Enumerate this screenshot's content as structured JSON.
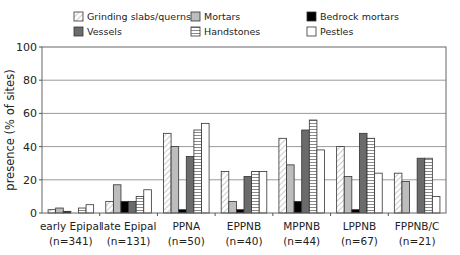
{
  "chart_data": {
    "type": "bar",
    "title": "",
    "xlabel": "",
    "ylabel": "presence (% of sites)",
    "ylim": [
      0,
      100
    ],
    "yticks": [
      0,
      20,
      40,
      60,
      80,
      100
    ],
    "grid": true,
    "legend_position": "top",
    "categories": [
      {
        "label": "early Epipal",
        "n": "(n=341)"
      },
      {
        "label": "late Epipal",
        "n": "(n=131)"
      },
      {
        "label": "PPNA",
        "n": "(n=50)"
      },
      {
        "label": "EPPNB",
        "n": "(n=40)"
      },
      {
        "label": "MPPNB",
        "n": "(n=44)"
      },
      {
        "label": "LPPNB",
        "n": "(n=67)"
      },
      {
        "label": "FPPNB/C",
        "n": "(n=21)"
      }
    ],
    "series": [
      {
        "name": "Grinding slabs/querns",
        "fill": "diag",
        "values": [
          2,
          7,
          48,
          25,
          45,
          40,
          24
        ]
      },
      {
        "name": "Mortars",
        "fill": "#bdbdbd",
        "values": [
          3,
          17,
          40,
          7,
          29,
          22,
          19
        ]
      },
      {
        "name": "Bedrock mortars",
        "fill": "#000000",
        "values": [
          1,
          7,
          2,
          2,
          7,
          2,
          0
        ]
      },
      {
        "name": "Vessels",
        "fill": "#6b6b6b",
        "values": [
          0,
          7,
          34,
          22,
          50,
          48,
          33
        ]
      },
      {
        "name": "Handstones",
        "fill": "hstripe",
        "values": [
          3,
          10,
          50,
          25,
          56,
          45,
          33
        ]
      },
      {
        "name": "Pestles",
        "fill": "#ffffff",
        "values": [
          5,
          14,
          54,
          25,
          38,
          24,
          10
        ]
      }
    ]
  }
}
